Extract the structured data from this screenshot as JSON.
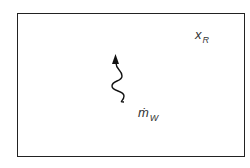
{
  "diagram": {
    "labels": {
      "xr": {
        "main": "x",
        "sub": "R"
      },
      "mw": {
        "main": "ṁ",
        "sub": "W"
      }
    },
    "arrow": {
      "type": "wavy-arrow",
      "direction": "up",
      "color": "#111111"
    }
  }
}
